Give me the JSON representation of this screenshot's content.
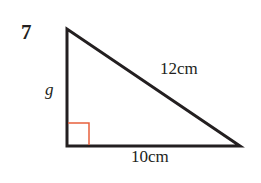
{
  "problem": {
    "number": "7",
    "labels": {
      "vertical_side": "g",
      "hypotenuse": "12cm",
      "base": "10cm"
    }
  },
  "colors": {
    "stroke": "#231f20",
    "right_angle_marker": "#e8603c"
  }
}
